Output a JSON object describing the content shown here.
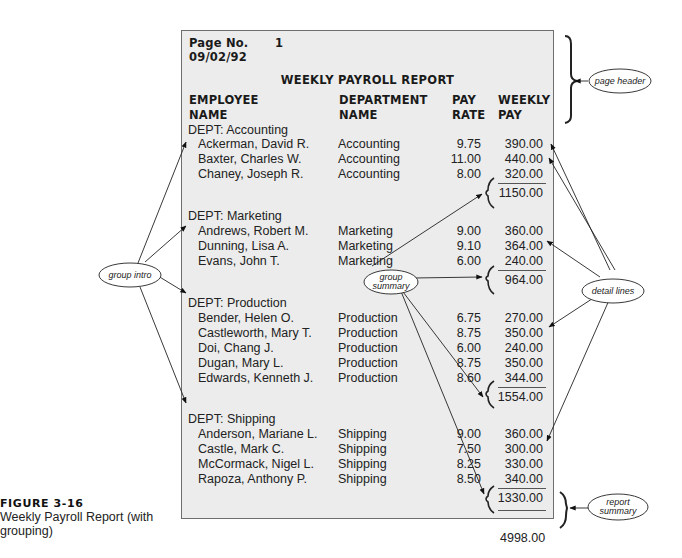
{
  "report": {
    "page_label": "Page No.",
    "page_number": "1",
    "date": "09/02/92",
    "title": "WEEKLY PAYROLL REPORT",
    "columns": [
      {
        "line1": "EMPLOYEE",
        "line2": "NAME"
      },
      {
        "line1": "DEPARTMENT",
        "line2": "NAME"
      },
      {
        "line1": "PAY",
        "line2": "RATE"
      },
      {
        "line1": "WEEKLY",
        "line2": "PAY"
      }
    ],
    "groups": [
      {
        "intro": "DEPT: Accounting",
        "rows": [
          {
            "name": "Ackerman, David R.",
            "dept": "Accounting",
            "rate": "9.75",
            "pay": "390.00"
          },
          {
            "name": "Baxter, Charles W.",
            "dept": "Accounting",
            "rate": "11.00",
            "pay": "440.00"
          },
          {
            "name": "Chaney, Joseph R.",
            "dept": "Accounting",
            "rate": "8.00",
            "pay": "320.00"
          }
        ],
        "summary": "1150.00"
      },
      {
        "intro": "DEPT: Marketing",
        "rows": [
          {
            "name": "Andrews, Robert M.",
            "dept": "Marketing",
            "rate": "9.00",
            "pay": "360.00"
          },
          {
            "name": "Dunning, Lisa A.",
            "dept": "Marketing",
            "rate": "9.10",
            "pay": "364.00"
          },
          {
            "name": "Evans, John T.",
            "dept": "Marketing",
            "rate": "6.00",
            "pay": "240.00"
          }
        ],
        "summary": "964.00"
      },
      {
        "intro": "DEPT: Production",
        "rows": [
          {
            "name": "Bender, Helen O.",
            "dept": "Production",
            "rate": "6.75",
            "pay": "270.00"
          },
          {
            "name": "Castleworth, Mary T.",
            "dept": "Production",
            "rate": "8.75",
            "pay": "350.00"
          },
          {
            "name": "Doi, Chang J.",
            "dept": "Production",
            "rate": "6.00",
            "pay": "240.00"
          },
          {
            "name": "Dugan, Mary L.",
            "dept": "Production",
            "rate": "8.75",
            "pay": "350.00"
          },
          {
            "name": "Edwards, Kenneth J.",
            "dept": "Production",
            "rate": "8.60",
            "pay": "344.00"
          }
        ],
        "summary": "1554.00"
      },
      {
        "intro": "DEPT: Shipping",
        "rows": [
          {
            "name": "Anderson, Mariane L.",
            "dept": "Shipping",
            "rate": "9.00",
            "pay": "360.00"
          },
          {
            "name": "Castle, Mark C.",
            "dept": "Shipping",
            "rate": "7.50",
            "pay": "300.00"
          },
          {
            "name": "McCormack, Nigel L.",
            "dept": "Shipping",
            "rate": "8.25",
            "pay": "330.00"
          },
          {
            "name": "Rapoza, Anthony P.",
            "dept": "Shipping",
            "rate": "8.50",
            "pay": "340.00"
          }
        ],
        "summary": "1330.00"
      }
    ],
    "report_total": "4998.00"
  },
  "callouts": {
    "page_header": "page header",
    "group_intro": "group intro",
    "group_summary_1": "group",
    "group_summary_2": "summary",
    "detail_lines": "detail lines",
    "report_summary_1": "report",
    "report_summary_2": "summary"
  },
  "caption": {
    "figure_number": "FIGURE 3-16",
    "description": "Weekly Payroll Report (with grouping)"
  }
}
